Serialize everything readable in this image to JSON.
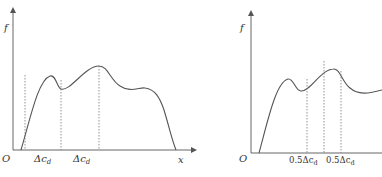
{
  "left_panel": {
    "y_axis_label": "f",
    "x_axis_label": "x",
    "origin_label": "O",
    "interval_labels": [
      "Δc_d",
      "Δc_d"
    ],
    "interval_label_text": [
      "Δc",
      "Δc"
    ],
    "interval_subscripts": [
      "d",
      "d"
    ],
    "dotted_guides": 3
  },
  "right_panel": {
    "y_axis_label": "f",
    "origin_label": "O",
    "interval_labels": [
      "0.5Δc_d",
      "0.5Δc_d"
    ],
    "interval_label_text": [
      "0.5Δc",
      "0.5Δc"
    ],
    "interval_subscripts": [
      "d",
      "d"
    ],
    "dotted_guides": 3
  }
}
